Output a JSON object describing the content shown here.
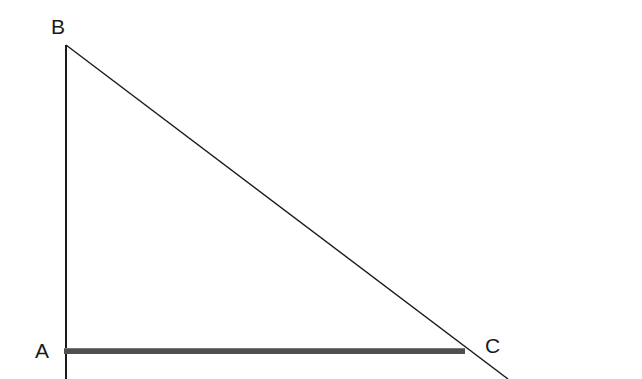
{
  "figure": {
    "kind": "geometry-diagram",
    "background_color": "#ffffff",
    "width": 642,
    "height": 379
  },
  "labels": {
    "a": "A",
    "b": "B",
    "c": "C"
  },
  "chart_data": {
    "type": "diagram",
    "title": "",
    "shape": "right-triangle",
    "points": [
      {
        "name": "A",
        "x": 66,
        "y": 351,
        "label": "A",
        "label_x": 35,
        "label_y": 340
      },
      {
        "name": "B",
        "x": 66,
        "y": 45,
        "label": "B",
        "label_x": 51,
        "label_y": 16
      },
      {
        "name": "C",
        "x": 465,
        "y": 351,
        "label": "C",
        "label_x": 485,
        "label_y": 335
      }
    ],
    "segments": [
      {
        "name": "AB-vertical-leg",
        "from": "B",
        "to": "A",
        "x1": 66,
        "y1": 45,
        "x2": 66,
        "y2": 379,
        "color": "#1a1a1a",
        "width": 2,
        "style": "thin",
        "extends_beyond": true
      },
      {
        "name": "AC-horizontal-leg",
        "from": "A",
        "to": "C",
        "x1": 64,
        "y1": 351,
        "x2": 465,
        "y2": 351,
        "color": "#555555",
        "width": 6,
        "style": "thick",
        "extends_beyond": false
      },
      {
        "name": "BC-hypotenuse",
        "from": "B",
        "to": "C",
        "x1": 66,
        "y1": 45,
        "x2": 508,
        "y2": 379,
        "color": "#1a1a1a",
        "width": 1.4,
        "style": "thin",
        "extends_beyond": true
      }
    ],
    "colors": {
      "stroke_thin": "#1a1a1a",
      "stroke_thick": "#555555",
      "thick_highlight": "#7a7a7a",
      "label": "#1a1a1a",
      "background": "#ffffff"
    },
    "xlabel": "",
    "ylabel": "",
    "grid": false,
    "legend": false
  }
}
